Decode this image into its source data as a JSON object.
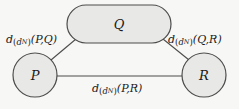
{
  "figure": {
    "type": "graph-diagram",
    "background_color": "#f7f7f5",
    "stroke_color": "#4d4d4d",
    "node_fill_color": "#e8e8e6",
    "text_color": "#1a1a1a"
  },
  "nodes": [
    {
      "id": "P",
      "label": "P",
      "shape": "circle",
      "cx": 35,
      "cy": 75,
      "r": 22
    },
    {
      "id": "Q",
      "label": "Q",
      "shape": "stadium",
      "cx": 119,
      "cy": 24,
      "w": 104,
      "h": 38
    },
    {
      "id": "R",
      "label": "R",
      "shape": "circle",
      "cx": 204,
      "cy": 75,
      "r": 22
    }
  ],
  "edges": [
    {
      "id": "pq",
      "from": "P",
      "to": "Q",
      "label": {
        "base": "d",
        "sub_base": "d",
        "sub_sub": "N",
        "args": "(P,Q)"
      },
      "label_text": "d_(d_N)(P,Q)"
    },
    {
      "id": "qr",
      "from": "Q",
      "to": "R",
      "label": {
        "base": "d",
        "sub_base": "d",
        "sub_sub": "N",
        "args": "(Q,R)"
      },
      "label_text": "d_(d_N)(Q,R)"
    },
    {
      "id": "pr",
      "from": "P",
      "to": "R",
      "label": {
        "base": "d",
        "sub_base": "d",
        "sub_sub": "N",
        "args": "(P,R)"
      },
      "label_text": "d_(d_N)(P,R)"
    }
  ]
}
